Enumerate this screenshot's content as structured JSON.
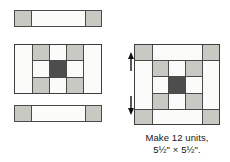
{
  "diagram": {
    "kind": "quilt-block-assembly-diagram",
    "caption": {
      "line1": "Make 12 units,",
      "line2": "5½\" × 5½\"."
    },
    "colors": {
      "white_fabric": "#fbfbfa",
      "gray_fabric": "#c9c9c4",
      "dark_fabric": "#4d4d4d",
      "outline": "#4a4a4a",
      "arrow": "#111111",
      "background": "#ffffff"
    },
    "arrows": {
      "top_left_label": "press-left-arrow",
      "top_right_label": "press-right-arrow",
      "left_top_label": "press-up-arrow",
      "left_bottom_label": "press-down-arrow"
    },
    "pieces": {
      "top_strip": {
        "name": "top-sashing-strip",
        "cells": [
          "gray",
          "white",
          "gray"
        ]
      },
      "center_row_unit": {
        "name": "center-row-unit",
        "columns": [
          "white",
          "ninepatch",
          "white"
        ],
        "ninepatch": [
          [
            "gray",
            "white",
            "gray"
          ],
          [
            "white",
            "dark",
            "white"
          ],
          [
            "gray",
            "white",
            "gray"
          ]
        ]
      },
      "bottom_strip": {
        "name": "bottom-sashing-strip",
        "cells": [
          "gray",
          "white",
          "gray"
        ]
      },
      "finished_block": {
        "name": "finished-block",
        "grid": [
          [
            "gray",
            "white",
            "white",
            "white",
            "gray"
          ],
          [
            "white",
            "gray",
            "white",
            "gray",
            "white"
          ],
          [
            "white",
            "white",
            "dark",
            "white",
            "white"
          ],
          [
            "white",
            "gray",
            "white",
            "gray",
            "white"
          ],
          [
            "gray",
            "white",
            "white",
            "white",
            "gray"
          ]
        ]
      }
    }
  }
}
